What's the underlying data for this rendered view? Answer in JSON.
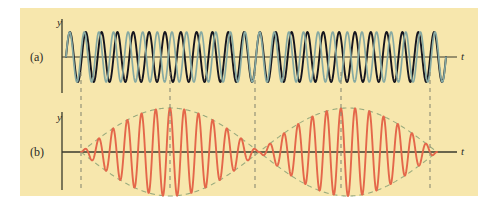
{
  "figure": {
    "background_color": "#ffffff",
    "panel": {
      "fill_color": "#f7e7ad",
      "x": 20,
      "y": 8,
      "width": 458,
      "height": 188
    }
  },
  "labels": {
    "panel_a": "(a)",
    "panel_b": "(b)",
    "y_axis_a": "y",
    "t_axis_a": "t",
    "y_axis_b": "y",
    "t_axis_b": "t"
  },
  "colors": {
    "panel_fill": "#f7e7ad",
    "wave_dark": "#15151f",
    "wave_teal": "#86a9a2",
    "wave_red": "#e4674a",
    "envelope_dashed": "#9aab7e",
    "axis_line": "#3a3a2c",
    "guide_dashed": "#8c8c74"
  },
  "chart_data": {
    "type": "line",
    "xlabel": "t",
    "ylabel": "y",
    "grid": false,
    "legend": "none",
    "panels": [
      {
        "id": "a",
        "label": "(a)",
        "xlabel": "t",
        "ylabel": "y",
        "axis_y_px": 57,
        "x_start_px": 62,
        "x_end_px": 446,
        "amplitude_px": 25,
        "series": [
          {
            "name": "wave-1-dark",
            "color": "#15151f",
            "cycles": 24,
            "phase_deg": 0,
            "amplitude": 1.0,
            "description": "first sinusoid, frequency f1"
          },
          {
            "name": "wave-2-teal",
            "color": "#86a9a2",
            "cycles": 26,
            "phase_deg": 0,
            "amplitude": 1.0,
            "description": "second sinusoid, slightly higher frequency f2"
          }
        ]
      },
      {
        "id": "b",
        "label": "(b)",
        "xlabel": "t",
        "ylabel": "y",
        "axis_y_px": 152,
        "x_start_px": 62,
        "x_end_px": 446,
        "amplitude_px": 44,
        "series": [
          {
            "name": "resultant-beat-wave",
            "color": "#e4674a",
            "carrier_cycles": 25,
            "envelope_cycles": 1,
            "amplitude": 1.0,
            "description": "resultant wave showing beat pattern, amplitude modulated"
          },
          {
            "name": "envelope-upper",
            "color": "#9aab7e",
            "style": "dashed",
            "description": "upper beat envelope"
          },
          {
            "name": "envelope-lower",
            "color": "#9aab7e",
            "style": "dashed",
            "description": "lower beat envelope"
          }
        ]
      }
    ],
    "guide_lines": {
      "color": "#8c8c74",
      "style": "dashed",
      "x_positions_px": [
        81,
        170,
        255,
        341,
        430
      ],
      "y_top_px": 72,
      "y_bottom_px": 190,
      "description": "vertical dashed lines linking beat nodes/antinodes between panels"
    }
  }
}
